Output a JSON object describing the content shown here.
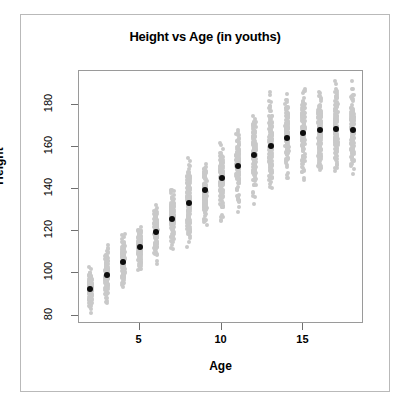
{
  "figure": {
    "title": "Height vs Age (in youths)",
    "background_color": "#ffffff",
    "frame_color": "#b9b9b9",
    "panel_border_color": "#9a9a9a"
  },
  "chart_data": {
    "type": "scatter",
    "title": "Height vs Age (in youths)",
    "xlabel": "Age",
    "ylabel": "Height",
    "xlim": [
      1.3,
      18.7
    ],
    "ylim": [
      76,
      196
    ],
    "grid": false,
    "legend": null,
    "xticks": [
      5,
      10,
      15
    ],
    "xtick_labels": [
      "5",
      "10",
      "15"
    ],
    "yticks": [
      80,
      100,
      120,
      140,
      160,
      180
    ],
    "ytick_labels": [
      "80",
      "100",
      "120",
      "140",
      "160",
      "180"
    ],
    "series": [
      {
        "name": "individual observations",
        "marker": "circle",
        "color": "#c9c9c9",
        "size": 4,
        "description": "Vertically jittered cloud of individual height measurements at each integer age."
      },
      {
        "name": "mean height",
        "marker": "circle",
        "color": "#0d0d0d",
        "size": 6,
        "x": [
          2,
          3,
          4,
          5,
          6,
          7,
          8,
          9,
          10,
          11,
          12,
          13,
          14,
          15,
          16,
          17,
          18
        ],
        "y": [
          92.5,
          99.3,
          105.6,
          112.7,
          119.6,
          126.0,
          133.3,
          139.5,
          145.3,
          150.8,
          156.2,
          160.5,
          164.1,
          166.5,
          167.8,
          168.7,
          168.0
        ]
      }
    ],
    "categories_x": [
      2,
      3,
      4,
      5,
      6,
      7,
      8,
      9,
      10,
      11,
      12,
      13,
      14,
      15,
      16,
      17,
      18
    ],
    "spread_min": [
      81,
      85,
      93,
      99,
      104,
      109,
      112,
      121,
      123,
      127,
      132,
      140,
      145,
      144,
      147,
      148,
      146
    ],
    "spread_max": [
      104,
      114,
      119,
      124,
      133,
      142,
      155,
      152,
      162,
      169,
      175,
      187,
      189,
      188,
      188,
      193,
      194
    ]
  }
}
